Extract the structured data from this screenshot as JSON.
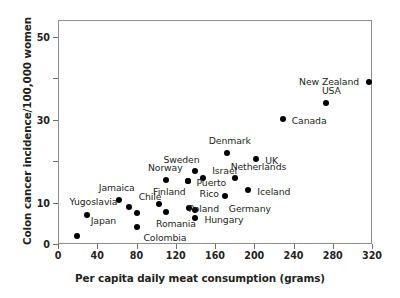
{
  "chart_data": {
    "type": "scatter",
    "title": "",
    "xlabel": "Per capita daily meat consumption (grams)",
    "ylabel": "Colon cancer incidence/100,000 women",
    "xlim": [
      0,
      320
    ],
    "ylim": [
      0,
      54
    ],
    "grid": false,
    "legend": "none",
    "xticks": [
      0,
      40,
      80,
      120,
      160,
      200,
      240,
      280,
      320
    ],
    "xtick_labels": [
      "0",
      "40",
      "80",
      "120",
      "160",
      "200",
      "240",
      "280",
      "320"
    ],
    "yticks": [
      0,
      10,
      20,
      30,
      40,
      50
    ],
    "ytick_labels": [
      "0",
      "10",
      "",
      "30",
      "",
      "50"
    ],
    "points": [
      {
        "label": "Japan",
        "x": 19,
        "y": 2.0,
        "lx": 14,
        "ly": -16
      },
      {
        "label": "Yugoslavia",
        "x": 30,
        "y": 7.0,
        "lx": -18,
        "ly": -14
      },
      {
        "label": "Jamaica",
        "x": 62,
        "y": 10.6,
        "lx": -20,
        "ly": -13
      },
      {
        "label": "Chile",
        "x": 72,
        "y": 9.0,
        "lx": 10,
        "ly": -11
      },
      {
        "label": "",
        "x": 80,
        "y": 7.5,
        "lx": 0,
        "ly": 0
      },
      {
        "label": "Colombia",
        "x": 81,
        "y": 4.0,
        "lx": 6,
        "ly": 10
      },
      {
        "label": "Finland",
        "x": 103,
        "y": 9.7,
        "lx": -6,
        "ly": -13
      },
      {
        "label": "Romania",
        "x": 110,
        "y": 7.8,
        "lx": -10,
        "ly": 11
      },
      {
        "label": "Norway",
        "x": 110,
        "y": 15.5,
        "lx": -18,
        "ly": -13
      },
      {
        "label": "Poland",
        "x": 133,
        "y": 8.7,
        "lx": 0,
        "ly": 0
      },
      {
        "label": "",
        "x": 140,
        "y": 8.3,
        "lx": 9,
        "ly": 1
      },
      {
        "label": "Hungary",
        "x": 140,
        "y": 6.3,
        "lx": 9,
        "ly": 1
      },
      {
        "label": "Puerto",
        "x": 132,
        "y": 15.3,
        "lx": 9,
        "ly": 1
      },
      {
        "label": "Rico",
        "x": 132,
        "y": 15.3,
        "lx": 12,
        "ly": 12
      },
      {
        "label": "Sweden",
        "x": 140,
        "y": 17.5,
        "lx": -32,
        "ly": -12
      },
      {
        "label": "Israel",
        "x": 148,
        "y": 16.0,
        "lx": 9,
        "ly": -8
      },
      {
        "label": "Germany",
        "x": 170,
        "y": 11.5,
        "lx": 4,
        "ly": 12
      },
      {
        "label": "Denmark",
        "x": 172,
        "y": 22.0,
        "lx": -18,
        "ly": -13
      },
      {
        "label": "Netherlands",
        "x": 180,
        "y": 16.0,
        "lx": -4,
        "ly": -12
      },
      {
        "label": "Iceland",
        "x": 194,
        "y": 13.0,
        "lx": 9,
        "ly": 1
      },
      {
        "label": "UK",
        "x": 202,
        "y": 20.5,
        "lx": 9,
        "ly": 1
      },
      {
        "label": "Canada",
        "x": 229,
        "y": 30.2,
        "lx": 9,
        "ly": 1
      },
      {
        "label": "USA",
        "x": 273,
        "y": 34.0,
        "lx": -4,
        "ly": -13
      },
      {
        "label": "New Zealand",
        "x": 317,
        "y": 39.0,
        "lx": -70,
        "ly": -1
      }
    ]
  }
}
